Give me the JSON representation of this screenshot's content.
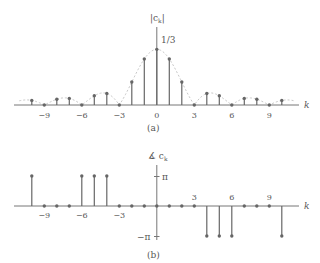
{
  "chart_data": [
    {
      "panel_label": "(a)",
      "type": "stem",
      "title": "",
      "ylabel": "|c_k|",
      "xlabel": "k",
      "x_ticks": [
        -9,
        -6,
        -3,
        0,
        3,
        6,
        9
      ],
      "x_tick_labels": [
        "−9",
        "−6",
        "−3",
        "0",
        "3",
        "6",
        "9"
      ],
      "y_annotation": "1/3",
      "x": [
        -10,
        -9,
        -8,
        -7,
        -6,
        -5,
        -4,
        -3,
        -2,
        -1,
        0,
        1,
        2,
        3,
        4,
        5,
        6,
        7,
        8,
        9,
        10
      ],
      "values": [
        0.0276,
        0,
        0.0345,
        0.0394,
        0,
        0.0551,
        0.0689,
        0,
        0.1378,
        0.2757,
        0.3333,
        0.2757,
        0.1378,
        0,
        0.0689,
        0.0551,
        0,
        0.0394,
        0.0345,
        0,
        0.0276
      ],
      "envelope": "dashed light-gray |sinc| curve",
      "grid": false
    },
    {
      "panel_label": "(b)",
      "type": "stem",
      "title": "",
      "ylabel": "∡ c_k",
      "xlabel": "k",
      "x_ticks": [
        -9,
        -6,
        -3,
        3,
        6,
        9
      ],
      "x_tick_labels": [
        "−9",
        "−6",
        "−3",
        "3",
        "6",
        "9"
      ],
      "y_ticks": [
        "π",
        "−π"
      ],
      "x": [
        -10,
        -9,
        -8,
        -7,
        -6,
        -5,
        -4,
        -3,
        -2,
        -1,
        0,
        1,
        2,
        3,
        4,
        5,
        6,
        7,
        8,
        9,
        10
      ],
      "values_in_pi": [
        1,
        0,
        0,
        0,
        1,
        1,
        1,
        0,
        0,
        0,
        0,
        0,
        0,
        0,
        -1,
        -1,
        -1,
        0,
        0,
        0,
        -1
      ],
      "ylim": [
        "−π",
        "π"
      ],
      "grid": false
    }
  ],
  "labels": {
    "panel_a": "(a)",
    "panel_b": "(b)",
    "mag_axis": "|c",
    "mag_sub": "k",
    "phase_axis": "∡ c",
    "phase_sub": "k",
    "k": "k",
    "one_third": "1/3",
    "pi": "π",
    "neg_pi": "−π"
  }
}
